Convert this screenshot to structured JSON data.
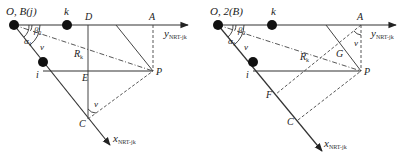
{
  "figure": {
    "panels": [
      {
        "id": "left",
        "origin_label": "O, B(j)",
        "k_label": "k",
        "i_label": "i",
        "D_label": "D",
        "A_label": "A",
        "E_label": "E",
        "P_label": "P",
        "C_label": "C",
        "R_label": "R",
        "R_sub": "k",
        "beta_label": "β",
        "beta_sub": "2",
        "alpha_label": "α",
        "alpha_sub": "1",
        "nu_label_1": "ν",
        "nu_label_2": "ν",
        "y_axis_label": "y",
        "y_axis_sub": "NRT-jk",
        "x_axis_label": "x",
        "x_axis_sub": "NRT-jk"
      },
      {
        "id": "right",
        "origin_label": "O, 2(B)",
        "k_label": "k",
        "i_label": "i",
        "A_label": "A",
        "G_label": "G",
        "P_label": "P",
        "F_label": "F",
        "C_label": "C",
        "R_label": "R",
        "R_sub": "k",
        "beta_label": "β",
        "beta_sub": "2",
        "alpha_label": "α",
        "alpha_sub": "1",
        "nu_label_1": "ν",
        "nu_label_2": "ν",
        "y_axis_label": "y",
        "y_axis_sub": "NRT-jk",
        "x_axis_label": "x",
        "x_axis_sub": "NRT-jk"
      }
    ],
    "caption": ""
  }
}
